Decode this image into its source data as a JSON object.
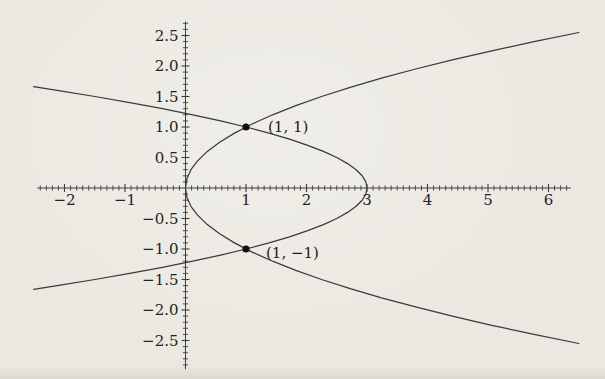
{
  "figure": {
    "background_color": "#ebe8e1",
    "line_color": "#3a3a3a",
    "text_color": "#232323"
  },
  "chart_data": {
    "type": "line",
    "title": "",
    "xlabel": "",
    "ylabel": "",
    "grid": false,
    "legend": "none",
    "x_axis": {
      "axis_min": -2.45,
      "axis_max": 6.37,
      "tick_min": -2.4,
      "tick_max": 6.3,
      "minor_step": 0.1,
      "labels": [
        {
          "v": -2,
          "label": "−2"
        },
        {
          "v": -1,
          "label": "−1"
        },
        {
          "v": 1,
          "label": "1"
        },
        {
          "v": 2,
          "label": "2"
        },
        {
          "v": 3,
          "label": "3"
        },
        {
          "v": 4,
          "label": "4"
        },
        {
          "v": 5,
          "label": "5"
        },
        {
          "v": 6,
          "label": "6"
        }
      ]
    },
    "y_axis": {
      "axis_min": -2.97,
      "axis_max": 2.73,
      "tick_min": -2.9,
      "tick_max": 2.7,
      "minor_step": 0.1,
      "labels": [
        {
          "v": 2.5,
          "label": "2.5"
        },
        {
          "v": 2.0,
          "label": "2.0"
        },
        {
          "v": 1.5,
          "label": "1.5"
        },
        {
          "v": 1.0,
          "label": "1.0"
        },
        {
          "v": 0.5,
          "label": "0.5"
        },
        {
          "v": -0.5,
          "label": "−0.5"
        },
        {
          "v": -1.0,
          "label": "−1.0"
        },
        {
          "v": -1.5,
          "label": "−1.5"
        },
        {
          "v": -2.0,
          "label": "−2.0"
        },
        {
          "v": -2.5,
          "label": "−2.5"
        }
      ]
    },
    "series": [
      {
        "name": "parabola-right-opening",
        "description": "right-opening parabola through the origin (y^2 = x)",
        "points": [
          [
            6.503,
            -2.55
          ],
          [
            5.76,
            -2.4
          ],
          [
            5.063,
            -2.25
          ],
          [
            4.41,
            -2.1
          ],
          [
            3.803,
            -1.95
          ],
          [
            3.24,
            -1.8
          ],
          [
            2.723,
            -1.65
          ],
          [
            2.25,
            -1.5
          ],
          [
            1.823,
            -1.35
          ],
          [
            1.44,
            -1.2
          ],
          [
            1.103,
            -1.05
          ],
          [
            0.81,
            -0.9
          ],
          [
            0.563,
            -0.75
          ],
          [
            0.36,
            -0.6
          ],
          [
            0.203,
            -0.45
          ],
          [
            0.09,
            -0.3
          ],
          [
            0.023,
            -0.15
          ],
          [
            0,
            0
          ],
          [
            0.023,
            0.15
          ],
          [
            0.09,
            0.3
          ],
          [
            0.203,
            0.45
          ],
          [
            0.36,
            0.6
          ],
          [
            0.563,
            0.75
          ],
          [
            0.81,
            0.9
          ],
          [
            1.103,
            1.05
          ],
          [
            1.44,
            1.2
          ],
          [
            1.823,
            1.35
          ],
          [
            2.25,
            1.5
          ],
          [
            2.723,
            1.65
          ],
          [
            3.24,
            1.8
          ],
          [
            3.803,
            1.95
          ],
          [
            4.41,
            2.1
          ],
          [
            5.063,
            2.25
          ],
          [
            5.76,
            2.4
          ],
          [
            6.503,
            2.55
          ]
        ]
      },
      {
        "name": "parabola-left-opening",
        "description": "left-opening parabola with vertex (3, 0) (x = 3 − 2y^2)",
        "points": [
          [
            -2.511,
            -1.66
          ],
          [
            -2.12,
            -1.6
          ],
          [
            -1.5,
            -1.5
          ],
          [
            -0.92,
            -1.4
          ],
          [
            -0.38,
            -1.3
          ],
          [
            0.12,
            -1.2
          ],
          [
            0.58,
            -1.1
          ],
          [
            1.0,
            -1.0
          ],
          [
            1.38,
            -0.9
          ],
          [
            1.72,
            -0.8
          ],
          [
            2.02,
            -0.7
          ],
          [
            2.28,
            -0.6
          ],
          [
            2.5,
            -0.5
          ],
          [
            2.68,
            -0.4
          ],
          [
            2.82,
            -0.3
          ],
          [
            2.92,
            -0.2
          ],
          [
            2.98,
            -0.1
          ],
          [
            3,
            0
          ],
          [
            2.98,
            0.1
          ],
          [
            2.92,
            0.2
          ],
          [
            2.82,
            0.3
          ],
          [
            2.68,
            0.4
          ],
          [
            2.5,
            0.5
          ],
          [
            2.28,
            0.6
          ],
          [
            2.02,
            0.7
          ],
          [
            1.72,
            0.8
          ],
          [
            1.38,
            0.9
          ],
          [
            1.0,
            1.0
          ],
          [
            0.58,
            1.1
          ],
          [
            0.12,
            1.2
          ],
          [
            -0.38,
            1.3
          ],
          [
            -0.92,
            1.4
          ],
          [
            -1.5,
            1.5
          ],
          [
            -2.12,
            1.6
          ],
          [
            -2.511,
            1.66
          ]
        ]
      }
    ],
    "marked_points": [
      {
        "x": 1,
        "y": 1,
        "label": "(1, 1)"
      },
      {
        "x": 1,
        "y": -1,
        "label": "(1, −1)"
      }
    ]
  }
}
